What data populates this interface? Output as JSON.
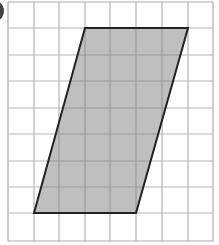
{
  "figure": {
    "type": "parallelogram-on-grid",
    "grid": {
      "columns": 8,
      "rows": 9,
      "x_lines": [
        8,
        34,
        59,
        85,
        110,
        136,
        162,
        188,
        213
      ],
      "y_lines": [
        2,
        28,
        55,
        81,
        108,
        134,
        161,
        187,
        213,
        241
      ],
      "line_color": "#b5b5b5",
      "border_color": "#aaaaaa"
    },
    "shape": {
      "name": "parallelogram",
      "vertices_grid": [
        [
          3,
          1
        ],
        [
          7,
          1
        ],
        [
          5,
          8
        ],
        [
          1,
          8
        ]
      ],
      "fill": "#bfbfbf",
      "stroke": "#222222",
      "grid_over_fill_color": "#9a9a9a"
    },
    "label_fragment": {
      "description": "cropped question label mark at top-left",
      "color": "#444444"
    }
  }
}
